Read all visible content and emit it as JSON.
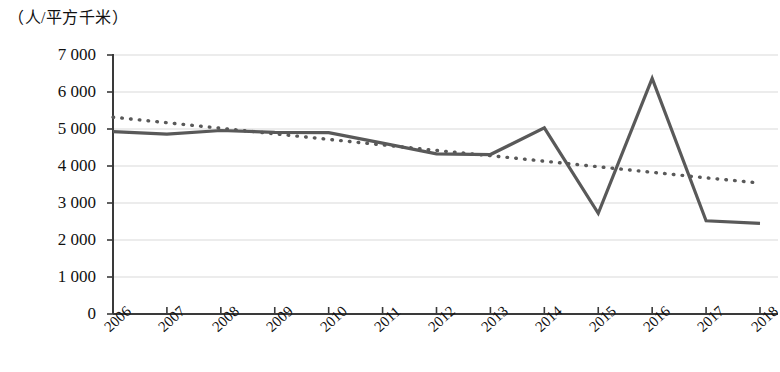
{
  "chart_data": {
    "type": "line",
    "title": "",
    "subtitle": "",
    "xlabel": "",
    "ylabel": "（人/平方千米）",
    "unit_label": "（人/平方千米）",
    "categories": [
      "2006",
      "2007",
      "2008",
      "2009",
      "2010",
      "2011",
      "2012",
      "2013",
      "2014",
      "2015",
      "2016",
      "2017",
      "2018"
    ],
    "ylim": [
      0,
      7000
    ],
    "ytick_values": [
      7000,
      6000,
      5000,
      4000,
      3000,
      2000,
      1000,
      0
    ],
    "ytick_labels": [
      "7 000",
      "6 000",
      "5 000",
      "4 000",
      "3 000",
      "2 000",
      "1 000",
      "0"
    ],
    "grid": true,
    "grid_axis": "y",
    "legend": "none",
    "series": [
      {
        "name": "人口密度",
        "style": "solid",
        "color": "#595959",
        "values": [
          4930,
          4860,
          4960,
          4910,
          4900,
          4620,
          4330,
          4310,
          5030,
          2720,
          6370,
          2520,
          2450
        ]
      },
      {
        "name": "线性趋势线",
        "style": "dotted",
        "color": "#595959",
        "values": [
          5320,
          5170,
          5020,
          4870,
          4720,
          4570,
          4420,
          4280,
          4130,
          3980,
          3830,
          3680,
          3540
        ]
      }
    ]
  },
  "axis": {
    "y_axis_name": "y-axis",
    "x_axis_name": "x-axis"
  },
  "colors": {
    "line": "#595959",
    "grid": "#d9d9d9",
    "axis": "#3a3a3a",
    "text": "#111111",
    "background": "#ffffff"
  }
}
